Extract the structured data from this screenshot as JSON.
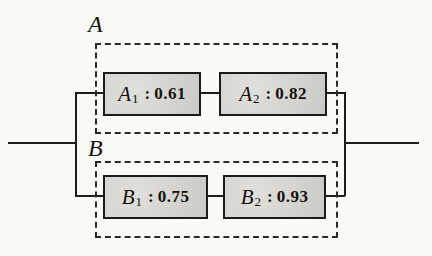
{
  "diagram": {
    "kind": "reliability-block-diagram",
    "groups": [
      {
        "label": "A",
        "blocks": [
          {
            "letter": "A",
            "subscript": "1",
            "separator": ":",
            "value": "0.61"
          },
          {
            "letter": "A",
            "subscript": "2",
            "separator": ":",
            "value": "0.82"
          }
        ]
      },
      {
        "label": "B",
        "blocks": [
          {
            "letter": "B",
            "subscript": "1",
            "separator": ":",
            "value": "0.75"
          },
          {
            "letter": "B",
            "subscript": "2",
            "separator": ":",
            "value": "0.93"
          }
        ]
      }
    ],
    "colors": {
      "background": "#fbfaf7",
      "block_fill": "#d7d5cf",
      "line": "#1d1d1b"
    }
  }
}
